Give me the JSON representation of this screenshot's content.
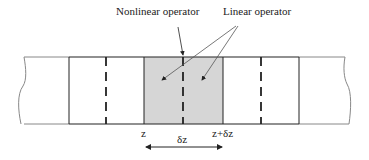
{
  "diagram": {
    "labels": {
      "nonlinear": "Nonlinear operator",
      "linear": "Linear operator",
      "z_start": "z",
      "z_end": "z+δz",
      "step": "δz"
    },
    "colors": {
      "line": "#222222",
      "shade": "#d6d6d6",
      "fiber_edge": "#888888"
    }
  }
}
